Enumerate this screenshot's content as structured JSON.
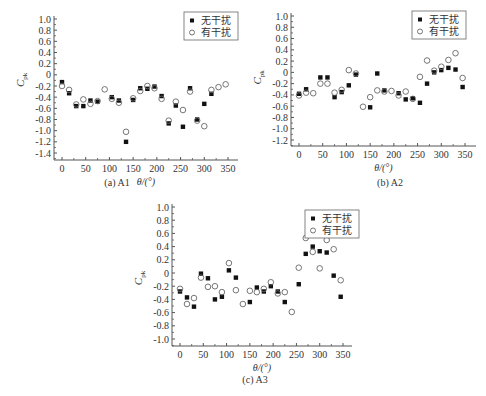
{
  "chart_data": [
    {
      "id": "A1",
      "type": "scatter",
      "caption": "(a) A1",
      "xlabel": "θ/(°)",
      "ylabel": "C_pk",
      "ylabel_main": "C",
      "ylabel_sub": "pk",
      "xlim": [
        -15,
        375
      ],
      "ylim": [
        -1.5,
        1.0
      ],
      "xticks": [
        0,
        50,
        100,
        150,
        200,
        250,
        300,
        350
      ],
      "yticks": [
        1.0,
        0.8,
        0.6,
        0.4,
        0.2,
        0,
        -0.2,
        -0.4,
        -0.6,
        -0.8,
        -1.0,
        -1.2,
        -1.4
      ],
      "ytick_labels": [
        "1.0",
        "0.8",
        "0.6",
        "0.4",
        "0.2",
        "0",
        "-0.2",
        "-0.4",
        "-0.6",
        "-0.8",
        "-1.0",
        "-1.2",
        "-1.4"
      ],
      "grid": false,
      "legend_position": "top-right",
      "series": [
        {
          "name": "无干扰",
          "marker": "filled-square",
          "x": [
            0,
            15,
            30,
            45,
            60,
            75,
            105,
            120,
            135,
            150,
            165,
            180,
            195,
            210,
            225,
            240,
            255,
            270,
            285,
            300,
            315
          ],
          "y": [
            -0.13,
            -0.33,
            -0.56,
            -0.56,
            -0.46,
            -0.48,
            -0.4,
            -0.46,
            -1.2,
            -0.45,
            -0.24,
            -0.25,
            -0.21,
            -0.38,
            -0.87,
            -0.55,
            -0.93,
            -0.24,
            -0.8,
            -0.52,
            -0.34
          ]
        },
        {
          "name": "有干扰",
          "marker": "open-circle",
          "x": [
            0,
            15,
            30,
            45,
            60,
            75,
            90,
            105,
            120,
            135,
            150,
            165,
            180,
            195,
            210,
            225,
            240,
            255,
            270,
            285,
            300,
            315,
            330,
            345
          ],
          "y": [
            -0.2,
            -0.27,
            -0.53,
            -0.44,
            -0.52,
            -0.47,
            -0.26,
            -0.43,
            -0.5,
            -1.02,
            -0.42,
            -0.29,
            -0.2,
            -0.24,
            -0.43,
            -0.82,
            -0.48,
            -0.63,
            -0.3,
            -0.82,
            -0.92,
            -0.27,
            -0.22,
            -0.17
          ]
        }
      ]
    },
    {
      "id": "A2",
      "type": "scatter",
      "caption": "(b) A2",
      "xlabel": "θ/(°)",
      "ylabel": "C_pk",
      "ylabel_main": "C",
      "ylabel_sub": "pk",
      "xlim": [
        -15,
        375
      ],
      "ylim": [
        -1.3,
        1.0
      ],
      "xticks": [
        0,
        50,
        100,
        150,
        200,
        250,
        300,
        350
      ],
      "yticks": [
        1.0,
        0.8,
        0.6,
        0.4,
        0.2,
        0,
        -0.2,
        -0.4,
        -0.6,
        -0.8,
        -1.0,
        -1.2
      ],
      "ytick_labels": [
        "1.0",
        "0.8",
        "0.6",
        "0.4",
        "0.2",
        "0",
        "-0.2",
        "-0.4",
        "-0.6",
        "-0.8",
        "-1.0",
        "-1.2"
      ],
      "grid": false,
      "legend_position": "top-right",
      "series": [
        {
          "name": "无干扰",
          "marker": "filled-square",
          "x": [
            0,
            15,
            45,
            60,
            75,
            90,
            105,
            120,
            150,
            165,
            180,
            210,
            225,
            240,
            255,
            270,
            285,
            300,
            315,
            330,
            345
          ],
          "y": [
            -0.38,
            -0.3,
            -0.09,
            -0.09,
            -0.44,
            -0.35,
            -0.23,
            -0.04,
            -0.62,
            -0.02,
            -0.32,
            -0.37,
            -0.48,
            -0.46,
            -0.54,
            -0.2,
            0.0,
            0.04,
            0.08,
            0.05,
            -0.26
          ]
        },
        {
          "name": "有干扰",
          "marker": "open-circle",
          "x": [
            0,
            15,
            30,
            45,
            60,
            75,
            90,
            105,
            120,
            135,
            150,
            165,
            180,
            195,
            210,
            225,
            240,
            255,
            270,
            285,
            300,
            315,
            330,
            345
          ],
          "y": [
            -0.41,
            -0.36,
            -0.37,
            -0.2,
            -0.2,
            -0.36,
            -0.31,
            0.04,
            -0.02,
            -0.61,
            -0.44,
            -0.32,
            -0.34,
            -0.33,
            -0.41,
            -0.34,
            -0.47,
            -0.08,
            0.21,
            0.03,
            0.1,
            0.22,
            0.34,
            -0.1
          ]
        }
      ]
    },
    {
      "id": "A3",
      "type": "scatter",
      "caption": "(c) A3",
      "xlabel": "θ/(°)",
      "ylabel": "C_pk",
      "ylabel_main": "C",
      "ylabel_sub": "pk",
      "xlim": [
        -15,
        375
      ],
      "ylim": [
        -1.1,
        1.0
      ],
      "xticks": [
        0,
        50,
        100,
        150,
        200,
        250,
        300,
        350
      ],
      "yticks": [
        1.0,
        0.8,
        0.6,
        0.4,
        0.2,
        0,
        -0.2,
        -0.4,
        -0.6,
        -0.8,
        -1.0
      ],
      "ytick_labels": [
        "1.0",
        "0.8",
        "0.6",
        "0.4",
        "0.2",
        "0",
        "-0.2",
        "-0.4",
        "-0.6",
        "-0.8",
        "-1.0"
      ],
      "grid": false,
      "legend_position": "top-right",
      "series": [
        {
          "name": "无干扰",
          "marker": "filled-square",
          "x": [
            0,
            15,
            30,
            45,
            60,
            75,
            90,
            105,
            120,
            150,
            165,
            180,
            195,
            210,
            225,
            255,
            270,
            285,
            300,
            315,
            330,
            345
          ],
          "y": [
            -0.28,
            -0.37,
            -0.51,
            -0.01,
            -0.08,
            -0.4,
            -0.36,
            0.04,
            -0.07,
            -0.44,
            -0.22,
            -0.28,
            -0.2,
            -0.28,
            -0.44,
            -0.17,
            0.29,
            0.4,
            0.33,
            0.31,
            -0.04,
            -0.36
          ]
        },
        {
          "name": "有干扰",
          "marker": "open-circle",
          "x": [
            0,
            15,
            30,
            45,
            60,
            75,
            90,
            105,
            120,
            135,
            150,
            165,
            180,
            195,
            210,
            225,
            240,
            255,
            270,
            285,
            300,
            315,
            330,
            345
          ],
          "y": [
            -0.24,
            -0.47,
            -0.38,
            -0.07,
            -0.21,
            -0.2,
            -0.29,
            0.15,
            -0.26,
            -0.47,
            -0.27,
            -0.29,
            -0.24,
            -0.14,
            -0.31,
            -0.29,
            -0.59,
            0.08,
            0.53,
            0.32,
            0.07,
            0.5,
            0.36,
            -0.11
          ]
        }
      ]
    }
  ],
  "layout": {
    "panels": [
      {
        "left": 62,
        "right": 228,
        "xmin_px_val": 0,
        "xmax_px_val": 350,
        "y_top_px": 19,
        "y_top_val": 1.0,
        "y_bot_px": 153,
        "y_bot_val": -1.4,
        "frame_left": 54,
        "frame_right": 238,
        "frame_top": 16,
        "frame_bottom": 160,
        "legend_x": 184,
        "legend_y": 12,
        "caption_x": 57,
        "caption_y": 176
      },
      {
        "left": 299,
        "right": 465,
        "xmin_px_val": 0,
        "xmax_px_val": 350,
        "y_top_px": 16,
        "y_top_val": 1.0,
        "y_bot_px": 140,
        "y_bot_val": -1.2,
        "frame_left": 291,
        "frame_right": 476,
        "frame_top": 13,
        "frame_bottom": 146,
        "legend_x": 412,
        "legend_y": 11,
        "caption_x": 330,
        "caption_y": 176
      },
      {
        "left": 180,
        "right": 343,
        "xmin_px_val": 0,
        "xmax_px_val": 350,
        "y_top_px": 207,
        "y_top_val": 1.0,
        "y_bot_px": 339,
        "y_bot_val": -1.0,
        "frame_left": 172,
        "frame_right": 352,
        "frame_top": 204,
        "frame_bottom": 346,
        "legend_x": 305,
        "legend_y": 210,
        "caption_x": 195,
        "caption_y": 373
      }
    ]
  },
  "colors": {
    "axis": "#555555",
    "marker_fill": "#111111",
    "marker_open_stroke": "#666666",
    "text": "#333333"
  }
}
